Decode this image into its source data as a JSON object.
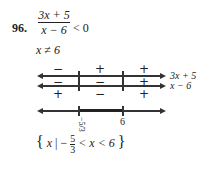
{
  "problem": {
    "number": "96.",
    "numerator": "3x + 5",
    "denominator": "x − 6",
    "relation": "< 0",
    "restriction": "x ≠ 6"
  },
  "sign_chart": {
    "rows": [
      {
        "label": "3x + 5",
        "signs": [
          "−",
          "+",
          "+"
        ]
      },
      {
        "label": "x − 6",
        "signs": [
          "−",
          "−",
          "+"
        ]
      },
      {
        "label": "quotient",
        "signs": [
          "+",
          "−",
          "+"
        ]
      }
    ]
  },
  "number_line": {
    "points": [
      "−5/3",
      "6"
    ],
    "point1_num": "5",
    "point1_den": "3",
    "point2": "6"
  },
  "solution": {
    "open": "{",
    "var": "x",
    "bar": "|",
    "minus": "−",
    "frac_num": "5",
    "frac_den": "3",
    "rest": "< x < 6",
    "close": "}"
  }
}
